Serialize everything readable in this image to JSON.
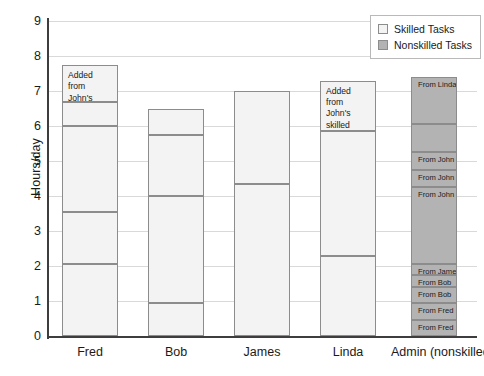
{
  "chart_data": {
    "type": "bar",
    "title": "",
    "subtitle": "",
    "xlabel": "",
    "ylabel": "Hours/day",
    "ylim": [
      0,
      9
    ],
    "ytick_labels": [
      "0",
      "1",
      "2",
      "3",
      "4",
      "5",
      "6",
      "7",
      "8",
      "9"
    ],
    "grid": true,
    "stacked": true,
    "legend_position": "top-right",
    "legend": [
      {
        "label": "Skilled Tasks",
        "color": "#f3f3f3",
        "key": "skilled"
      },
      {
        "label": "Nonskilled Tasks",
        "color": "#b3b3b3",
        "key": "nonskilled"
      }
    ],
    "categories": [
      "Fred",
      "Bob",
      "James",
      "Linda",
      "Admin (nonskilled)"
    ],
    "totals": [
      7.75,
      6.5,
      7.0,
      7.3,
      7.4
    ],
    "bars": [
      {
        "category": "Fred",
        "type": "skilled",
        "total": 7.75,
        "boundaries": [
          0,
          2.05,
          3.55,
          6.0,
          6.7,
          7.75
        ],
        "segments": [
          {
            "from": 0,
            "to": 2.05,
            "value": 2.05,
            "label": ""
          },
          {
            "from": 2.05,
            "to": 3.55,
            "value": 1.5,
            "label": ""
          },
          {
            "from": 3.55,
            "to": 6.0,
            "value": 2.45,
            "label": ""
          },
          {
            "from": 6.0,
            "to": 6.7,
            "value": 0.7,
            "label": ""
          },
          {
            "from": 6.7,
            "to": 7.75,
            "value": 1.05,
            "label": "Added from John's skilled tasks"
          }
        ]
      },
      {
        "category": "Bob",
        "type": "skilled",
        "total": 6.5,
        "boundaries": [
          0,
          0.95,
          4.0,
          5.75,
          6.5
        ],
        "segments": [
          {
            "from": 0,
            "to": 0.95,
            "value": 0.95,
            "label": ""
          },
          {
            "from": 0.95,
            "to": 4.0,
            "value": 3.05,
            "label": ""
          },
          {
            "from": 4.0,
            "to": 5.75,
            "value": 1.75,
            "label": ""
          },
          {
            "from": 5.75,
            "to": 6.5,
            "value": 0.75,
            "label": ""
          }
        ]
      },
      {
        "category": "James",
        "type": "skilled",
        "total": 7.0,
        "boundaries": [
          0,
          4.35,
          7.0
        ],
        "segments": [
          {
            "from": 0,
            "to": 4.35,
            "value": 4.35,
            "label": ""
          },
          {
            "from": 4.35,
            "to": 7.0,
            "value": 2.65,
            "label": ""
          }
        ]
      },
      {
        "category": "Linda",
        "type": "skilled",
        "total": 7.3,
        "boundaries": [
          0,
          2.3,
          5.85,
          7.3
        ],
        "segments": [
          {
            "from": 0,
            "to": 2.3,
            "value": 2.3,
            "label": ""
          },
          {
            "from": 2.3,
            "to": 5.85,
            "value": 3.55,
            "label": ""
          },
          {
            "from": 5.85,
            "to": 7.3,
            "value": 1.45,
            "label": "Added from John's skilled tasks"
          }
        ]
      },
      {
        "category": "Admin (nonskilled)",
        "type": "nonskilled",
        "total": 7.4,
        "boundaries": [
          0,
          0.45,
          0.95,
          1.4,
          1.75,
          2.05,
          4.25,
          4.75,
          5.25,
          6.05,
          7.4
        ],
        "segments": [
          {
            "from": 0,
            "to": 0.45,
            "value": 0.45,
            "label": "From Fred"
          },
          {
            "from": 0.45,
            "to": 0.95,
            "value": 0.5,
            "label": "From Fred"
          },
          {
            "from": 0.95,
            "to": 1.4,
            "value": 0.45,
            "label": "From Bob"
          },
          {
            "from": 1.4,
            "to": 1.75,
            "value": 0.35,
            "label": "From Bob"
          },
          {
            "from": 1.75,
            "to": 2.05,
            "value": 0.3,
            "label": "From James"
          },
          {
            "from": 2.05,
            "to": 4.25,
            "value": 2.2,
            "label": "From John"
          },
          {
            "from": 4.25,
            "to": 4.75,
            "value": 0.5,
            "label": "From John"
          },
          {
            "from": 4.75,
            "to": 5.25,
            "value": 0.5,
            "label": "From John"
          },
          {
            "from": 5.25,
            "to": 6.05,
            "value": 0.8,
            "label": ""
          },
          {
            "from": 6.05,
            "to": 7.4,
            "value": 1.35,
            "label": "From Linda"
          }
        ]
      }
    ],
    "annotations": [
      {
        "text": "Added from John's skilled tasks",
        "category": "Fred"
      },
      {
        "text": "Added from John's skilled tasks",
        "category": "Linda"
      }
    ]
  }
}
